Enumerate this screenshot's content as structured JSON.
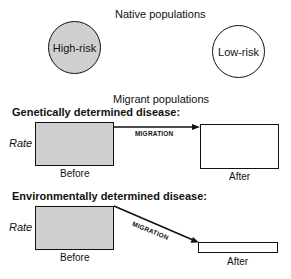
{
  "native": {
    "title": "Native populations",
    "high_risk_label": "High-risk",
    "low_risk_label": "Low-risk",
    "high_risk_fill": "#cfcfcf",
    "low_risk_fill": "#ffffff"
  },
  "migrant": {
    "title": "Migrant populations"
  },
  "genetic": {
    "heading": "Genetically determined disease:",
    "axis_label": "Rate",
    "arrow_label": "MIGRATION",
    "before_label": "Before",
    "after_label": "After"
  },
  "environmental": {
    "heading": "Environmentally determined disease:",
    "axis_label": "Rate",
    "arrow_label": "MIGRATION",
    "before_label": "Before",
    "after_label": "After"
  }
}
